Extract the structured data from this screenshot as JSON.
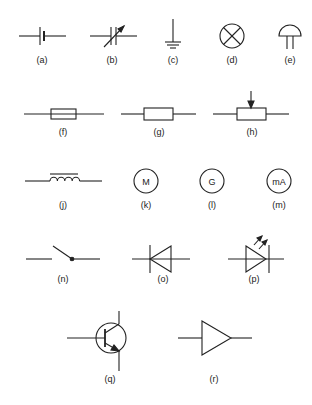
{
  "diagram": {
    "stroke_color": "#222222",
    "background": "#ffffff",
    "symbols": [
      {
        "id": "a",
        "label": "(a)",
        "name": "cell"
      },
      {
        "id": "b",
        "label": "(b)",
        "name": "variable capacitor"
      },
      {
        "id": "c",
        "label": "(c)",
        "name": "earth"
      },
      {
        "id": "d",
        "label": "(d)",
        "name": "lamp"
      },
      {
        "id": "e",
        "label": "(e)",
        "name": "microphone"
      },
      {
        "id": "f",
        "label": "(f)",
        "name": "fuse"
      },
      {
        "id": "g",
        "label": "(g)",
        "name": "resistor"
      },
      {
        "id": "h",
        "label": "(h)",
        "name": "potentiometer"
      },
      {
        "id": "j",
        "label": "(j)",
        "name": "iron-core inductor"
      },
      {
        "id": "k",
        "label": "(k)",
        "name": "motor",
        "text": "M"
      },
      {
        "id": "l",
        "label": "(l)",
        "name": "generator",
        "text": "G"
      },
      {
        "id": "m",
        "label": "(m)",
        "name": "milliammeter",
        "text": "mA"
      },
      {
        "id": "n",
        "label": "(n)",
        "name": "switch"
      },
      {
        "id": "o",
        "label": "(o)",
        "name": "diode"
      },
      {
        "id": "p",
        "label": "(p)",
        "name": "light-emitting diode"
      },
      {
        "id": "q",
        "label": "(q)",
        "name": "transistor"
      },
      {
        "id": "r",
        "label": "(r)",
        "name": "amplifier"
      }
    ]
  }
}
